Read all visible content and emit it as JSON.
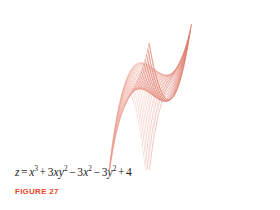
{
  "figure": {
    "caption": "FIGURE 27",
    "caption_color": "#e8491f",
    "background_color": "#ffffff",
    "equation_plain": "z = x^3 + 3xy^2 - 3x^2 - 3y^2 + 4",
    "equation_parts": {
      "lhs": "z",
      "equals": "=",
      "t1_base": "x",
      "t1_exp": "3",
      "op1": "+",
      "t2_coef": "3",
      "t2_x": "x",
      "t2_y": "y",
      "t2_exp": "2",
      "op2": "−",
      "t3_coef": "3",
      "t3_base": "x",
      "t3_exp": "2",
      "op3": "−",
      "t4_coef": "3",
      "t4_base": "y",
      "t4_exp": "2",
      "op4": "+",
      "t5_const": "4"
    }
  },
  "chart_data": {
    "type": "surface-mesh",
    "title": "",
    "subtitle": "",
    "xlabel": "x",
    "ylabel": "y",
    "zlabel": "z",
    "equation": "z = x^3 + 3xy^2 - 3x^2 - 3y^2 + 4",
    "surface": {
      "formula_coefficients": {
        "x3": 1,
        "xy2": 3,
        "x2": -3,
        "y2": -3,
        "const": 4
      },
      "x_range": [
        -1.2,
        2.4
      ],
      "y_range": [
        -1.6,
        1.6
      ],
      "z_range": [
        -6,
        6
      ],
      "u_divisions": 34,
      "v_divisions": 34
    },
    "projection": {
      "type": "axonometric",
      "origin_px": [
        141,
        88
      ],
      "x_axis_px": [
        1.22,
        0.62
      ],
      "y_axis_px": [
        1.32,
        -0.6
      ],
      "z_axis_px": [
        0,
        -6.1
      ]
    },
    "style": {
      "mesh_color_light": "#f0a79a",
      "mesh_color_dark": "#cf4a34",
      "mesh_color_mid": "#e07a63",
      "stroke_width": 0.38,
      "grid": true,
      "legend": false,
      "axes_visible": false
    },
    "key_features": [
      {
        "name": "top-vertex-px",
        "x": 141,
        "y": 12
      },
      {
        "name": "left-vertex-px",
        "x": 16,
        "y": 33
      },
      {
        "name": "bottom-vertex-px",
        "x": 140,
        "y": 164
      },
      {
        "name": "right-tail-exit-px",
        "x": 279,
        "y": 126
      }
    ]
  }
}
